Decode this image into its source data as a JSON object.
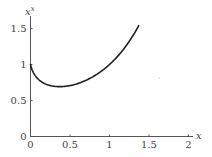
{
  "chart_data": {
    "type": "line",
    "title": "",
    "xlabel": "x",
    "ylabel": "x^x",
    "ylabel_base": "x",
    "ylabel_exp": "x",
    "xlim": [
      0,
      2
    ],
    "ylim": [
      0,
      1.6
    ],
    "x_ticks": [
      0,
      0.5,
      1,
      1.5,
      2
    ],
    "x_tick_labels": [
      "0",
      "0.5",
      "1",
      "1.5",
      "2"
    ],
    "y_ticks": [
      0,
      0.5,
      1,
      1.5
    ],
    "y_tick_labels": [
      "0",
      "0.5",
      "1",
      "1.5"
    ],
    "grid": false,
    "legend": null,
    "series": [
      {
        "name": "x^x",
        "color": "#222222",
        "x": [
          0.0,
          0.02,
          0.05,
          0.1,
          0.15,
          0.2,
          0.25,
          0.3,
          0.368,
          0.45,
          0.5,
          0.6,
          0.7,
          0.8,
          0.9,
          1.0,
          1.1,
          1.2,
          1.3,
          1.37
        ],
        "y": [
          1.0,
          0.925,
          0.861,
          0.794,
          0.752,
          0.725,
          0.707,
          0.697,
          0.692,
          0.698,
          0.707,
          0.736,
          0.779,
          0.837,
          0.91,
          1.0,
          1.11,
          1.245,
          1.406,
          1.539
        ]
      }
    ]
  }
}
